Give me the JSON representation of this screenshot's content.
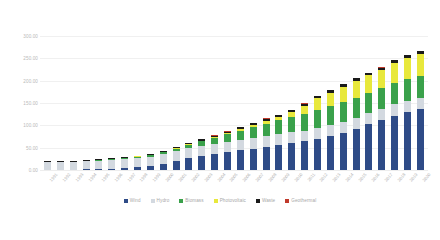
{
  "chart_data": {
    "type": "bar",
    "title": "",
    "subtitle": "",
    "xlabel": "",
    "ylabel": "",
    "stacked": true,
    "grid": true,
    "legend_position": "bottom",
    "ylim": [
      0,
      300
    ],
    "ytick_values": [
      300.0,
      250.0,
      200.0,
      150.0,
      100.0,
      50.0,
      0.0
    ],
    "ytick_labels": [
      "300.00",
      "250.00",
      "200.00",
      "150.00",
      "100.00",
      "50.00",
      "0.00"
    ],
    "categories": [
      "1991",
      "1992",
      "1993",
      "1994",
      "1995",
      "1996",
      "1997",
      "1998",
      "1999",
      "2000",
      "2001",
      "2002",
      "2003",
      "2004",
      "2005",
      "2006",
      "2007",
      "2008",
      "2009",
      "2010",
      "2011",
      "2012",
      "2013",
      "2014",
      "2015",
      "2016",
      "2017",
      "2018",
      "2019",
      "2020"
    ],
    "series": [
      {
        "name": "Wind",
        "color": "#2e4b87",
        "values": [
          0.3,
          0.6,
          1.0,
          1.5,
          2.2,
          3.0,
          4.5,
          6.5,
          9.5,
          14.0,
          20.0,
          27.0,
          32.0,
          36.0,
          40.0,
          44.0,
          48.0,
          52.0,
          56.0,
          60.0,
          64.0,
          70.0,
          76.0,
          83.0,
          92.0,
          102.0,
          112.0,
          122.0,
          130.0,
          136.0
        ],
        "stack_order": 0
      },
      {
        "name": "Hydro",
        "color": "#d3d9e0",
        "values": [
          16.0,
          16.5,
          17.0,
          18.0,
          18.5,
          19.0,
          19.5,
          20.0,
          20.5,
          21.0,
          21.5,
          22.0,
          22.5,
          23.0,
          23.0,
          23.5,
          23.5,
          24.0,
          24.0,
          24.0,
          24.0,
          24.5,
          24.5,
          24.5,
          25.0,
          25.0,
          25.0,
          25.0,
          25.0,
          25.0
        ],
        "stack_order": 1
      },
      {
        "name": "Biomass",
        "color": "#3aa14b",
        "values": [
          0.5,
          0.7,
          1.0,
          1.3,
          1.6,
          2.0,
          2.5,
          3.0,
          3.5,
          4.5,
          6.0,
          8.0,
          10.0,
          13.0,
          17.0,
          21.0,
          25.0,
          28.0,
          31.0,
          34.0,
          37.0,
          40.0,
          42.0,
          44.0,
          45.0,
          46.0,
          47.0,
          48.0,
          48.5,
          49.0
        ],
        "stack_order": 2
      },
      {
        "name": "Photovoltaic",
        "color": "#e8e83c",
        "values": [
          0.0,
          0.0,
          0.0,
          0.0,
          0.0,
          0.0,
          0.0,
          0.1,
          0.1,
          0.2,
          0.3,
          0.5,
          0.8,
          1.3,
          2.2,
          3.5,
          5.0,
          6.5,
          8.0,
          12.0,
          19.0,
          26.0,
          31.0,
          35.0,
          38.0,
          39.0,
          40.0,
          45.0,
          48.0,
          50.0
        ],
        "stack_order": 3
      },
      {
        "name": "Waste",
        "color": "#1a1a1a",
        "values": [
          1.5,
          1.6,
          1.7,
          1.8,
          1.9,
          2.0,
          2.1,
          2.2,
          2.3,
          2.5,
          2.7,
          2.9,
          3.1,
          3.3,
          3.5,
          3.7,
          3.9,
          4.1,
          4.3,
          4.5,
          4.7,
          4.9,
          5.0,
          5.1,
          5.2,
          5.3,
          5.4,
          5.5,
          5.6,
          5.7
        ],
        "stack_order": 4
      },
      {
        "name": "Geothermal",
        "color": "#c0392b",
        "values": [
          0.0,
          0.0,
          0.0,
          0.0,
          0.0,
          0.0,
          0.0,
          0.0,
          0.0,
          0.0,
          0.0,
          0.0,
          0.0,
          0.05,
          0.1,
          0.1,
          0.15,
          0.2,
          0.2,
          0.25,
          0.3,
          0.3,
          0.35,
          0.4,
          0.4,
          0.45,
          0.5,
          0.5,
          0.55,
          0.6
        ],
        "stack_order": 5
      }
    ]
  },
  "legend": {
    "items": [
      {
        "label": "Wind",
        "color": "#2e4b87"
      },
      {
        "label": "Hydro",
        "color": "#d3d9e0"
      },
      {
        "label": "Biomass",
        "color": "#3aa14b"
      },
      {
        "label": "Photovoltaic",
        "color": "#e8e83c"
      },
      {
        "label": "Waste",
        "color": "#1a1a1a"
      },
      {
        "label": "Geothermal",
        "color": "#c0392b"
      }
    ]
  }
}
